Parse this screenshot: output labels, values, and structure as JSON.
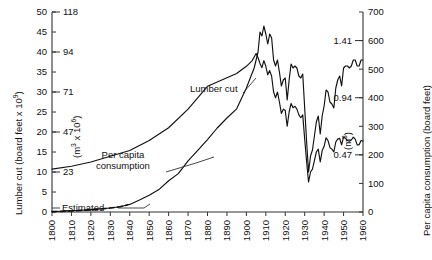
{
  "chart_data": {
    "type": "line",
    "title": "",
    "xlabel": "",
    "xlim": [
      1800,
      1960
    ],
    "x_ticks": [
      "1800",
      "1810",
      "1820",
      "1830",
      "1840",
      "1850",
      "1860",
      "1870",
      "1880",
      "1890",
      "1900",
      "1910",
      "1920",
      "1930",
      "1940",
      "1950",
      "1960"
    ],
    "grid": false,
    "legend": "inline-annotations",
    "axes": {
      "left_primary": {
        "label": "Lumber cut (board feet x 10",
        "label_exponent": "9",
        "label_suffix": ")",
        "ticks": [
          0,
          5,
          10,
          15,
          20,
          25,
          30,
          35,
          40,
          45,
          50
        ],
        "lim": [
          0,
          50
        ]
      },
      "left_secondary": {
        "label": "(m",
        "label_exponent_unit": "3",
        "label_mid": " x 10",
        "label_exponent_scale": "6",
        "label_suffix": ")",
        "ticks": [
          {
            "value": 10,
            "text": "23"
          },
          {
            "value": 20,
            "text": "47"
          },
          {
            "value": 30,
            "text": "71"
          },
          {
            "value": 40,
            "text": "94"
          },
          {
            "value": 50,
            "text": "118"
          }
        ]
      },
      "right_primary": {
        "label": "Per capita consumption (board feet)",
        "ticks": [
          0,
          100,
          200,
          300,
          400,
          500,
          600,
          700
        ],
        "lim": [
          0,
          700
        ]
      },
      "right_secondary": {
        "label": "(m",
        "label_exponent_unit": "3",
        "label_suffix": ")",
        "ticks": [
          {
            "value": 200,
            "text": "0.47"
          },
          {
            "value": 400,
            "text": "0.94"
          },
          {
            "value": 600,
            "text": "1.41"
          }
        ]
      }
    },
    "annotations": [
      {
        "name": "lumber-cut",
        "text": "Lumber cut"
      },
      {
        "name": "per-capita-consumption-line1",
        "text": "Per capita"
      },
      {
        "name": "per-capita-consumption-line2",
        "text": "consumption"
      },
      {
        "name": "estimated",
        "text": "Estimated"
      }
    ],
    "series": [
      {
        "name": "Lumber cut",
        "axis": "left",
        "unit": "board feet x 10^9",
        "style": "solid",
        "points": [
          [
            1800,
            0.1
          ],
          [
            1805,
            0.2
          ],
          [
            1810,
            0.3
          ],
          [
            1815,
            0.45
          ],
          [
            1820,
            0.6
          ],
          [
            1825,
            0.8
          ],
          [
            1830,
            1.0
          ],
          [
            1835,
            1.3
          ],
          [
            1839,
            1.8
          ],
          [
            1840,
            1.9
          ],
          [
            1845,
            3.0
          ],
          [
            1850,
            4.2
          ],
          [
            1855,
            5.6
          ],
          [
            1860,
            7.8
          ],
          [
            1865,
            9.6
          ],
          [
            1870,
            12.8
          ],
          [
            1875,
            15.4
          ],
          [
            1880,
            18.1
          ],
          [
            1885,
            21.0
          ],
          [
            1890,
            23.5
          ],
          [
            1895,
            25.8
          ],
          [
            1900,
            31.0
          ],
          [
            1902,
            33.5
          ],
          [
            1904,
            36.0
          ],
          [
            1906,
            40.0
          ],
          [
            1907,
            45.0
          ],
          [
            1908,
            44.0
          ],
          [
            1909,
            46.5
          ],
          [
            1910,
            44.5
          ],
          [
            1911,
            42.0
          ],
          [
            1912,
            44.5
          ],
          [
            1913,
            43.5
          ],
          [
            1914,
            38.0
          ],
          [
            1915,
            36.5
          ],
          [
            1916,
            38.0
          ],
          [
            1917,
            35.0
          ],
          [
            1918,
            31.5
          ],
          [
            1919,
            33.0
          ],
          [
            1920,
            33.5
          ],
          [
            1921,
            28.0
          ],
          [
            1922,
            33.0
          ],
          [
            1923,
            37.0
          ],
          [
            1924,
            36.0
          ],
          [
            1925,
            36.5
          ],
          [
            1926,
            36.0
          ],
          [
            1927,
            34.0
          ],
          [
            1928,
            33.5
          ],
          [
            1929,
            34.5
          ],
          [
            1930,
            26.0
          ],
          [
            1931,
            17.5
          ],
          [
            1932,
            10.0
          ],
          [
            1933,
            14.0
          ],
          [
            1934,
            15.5
          ],
          [
            1935,
            19.0
          ],
          [
            1936,
            22.5
          ],
          [
            1937,
            24.0
          ],
          [
            1938,
            19.5
          ],
          [
            1939,
            24.0
          ],
          [
            1940,
            26.5
          ],
          [
            1941,
            30.5
          ],
          [
            1942,
            30.0
          ],
          [
            1943,
            27.5
          ],
          [
            1944,
            27.0
          ],
          [
            1945,
            26.0
          ],
          [
            1946,
            31.0
          ],
          [
            1947,
            33.0
          ],
          [
            1948,
            34.0
          ],
          [
            1949,
            31.5
          ],
          [
            1950,
            36.0
          ],
          [
            1951,
            36.5
          ],
          [
            1952,
            36.5
          ],
          [
            1953,
            36.0
          ],
          [
            1954,
            36.5
          ],
          [
            1955,
            38.0
          ],
          [
            1956,
            38.0
          ],
          [
            1957,
            36.5
          ],
          [
            1958,
            36.5
          ],
          [
            1959,
            38.0
          ],
          [
            1960,
            38.0
          ]
        ]
      },
      {
        "name": "Lumber cut (estimated)",
        "axis": "left",
        "unit": "board feet x 10^9",
        "style": "dashed",
        "points": [
          [
            1800,
            0.1
          ],
          [
            1805,
            0.15
          ],
          [
            1810,
            0.25
          ],
          [
            1815,
            0.4
          ],
          [
            1820,
            0.55
          ],
          [
            1825,
            0.75
          ],
          [
            1830,
            1.0
          ],
          [
            1835,
            1.3
          ],
          [
            1839,
            1.8
          ]
        ]
      },
      {
        "name": "Per capita consumption",
        "axis": "right",
        "unit": "board feet",
        "style": "solid",
        "points": [
          [
            1800,
            150
          ],
          [
            1810,
            160
          ],
          [
            1820,
            175
          ],
          [
            1830,
            195
          ],
          [
            1840,
            215
          ],
          [
            1850,
            250
          ],
          [
            1860,
            295
          ],
          [
            1870,
            360
          ],
          [
            1880,
            440
          ],
          [
            1890,
            470
          ],
          [
            1895,
            485
          ],
          [
            1900,
            510
          ],
          [
            1903,
            530
          ],
          [
            1905,
            555
          ],
          [
            1906,
            540
          ],
          [
            1907,
            520
          ],
          [
            1908,
            505
          ],
          [
            1909,
            530
          ],
          [
            1910,
            510
          ],
          [
            1911,
            480
          ],
          [
            1912,
            495
          ],
          [
            1913,
            475
          ],
          [
            1914,
            420
          ],
          [
            1915,
            400
          ],
          [
            1916,
            420
          ],
          [
            1917,
            385
          ],
          [
            1918,
            345
          ],
          [
            1919,
            360
          ],
          [
            1920,
            355
          ],
          [
            1921,
            300
          ],
          [
            1922,
            350
          ],
          [
            1923,
            380
          ],
          [
            1924,
            365
          ],
          [
            1925,
            370
          ],
          [
            1926,
            360
          ],
          [
            1927,
            340
          ],
          [
            1928,
            330
          ],
          [
            1929,
            340
          ],
          [
            1930,
            255
          ],
          [
            1931,
            175
          ],
          [
            1932,
            105
          ],
          [
            1933,
            140
          ],
          [
            1934,
            150
          ],
          [
            1935,
            180
          ],
          [
            1936,
            210
          ],
          [
            1937,
            220
          ],
          [
            1938,
            175
          ],
          [
            1939,
            215
          ],
          [
            1940,
            230
          ],
          [
            1941,
            260
          ],
          [
            1942,
            250
          ],
          [
            1943,
            225
          ],
          [
            1944,
            220
          ],
          [
            1945,
            210
          ],
          [
            1946,
            245
          ],
          [
            1947,
            255
          ],
          [
            1948,
            258
          ],
          [
            1949,
            235
          ],
          [
            1950,
            262
          ],
          [
            1951,
            258
          ],
          [
            1952,
            250
          ],
          [
            1953,
            248
          ],
          [
            1954,
            252
          ],
          [
            1955,
            262
          ],
          [
            1956,
            255
          ],
          [
            1957,
            235
          ],
          [
            1958,
            235
          ],
          [
            1959,
            250
          ],
          [
            1960,
            248
          ]
        ]
      }
    ]
  }
}
